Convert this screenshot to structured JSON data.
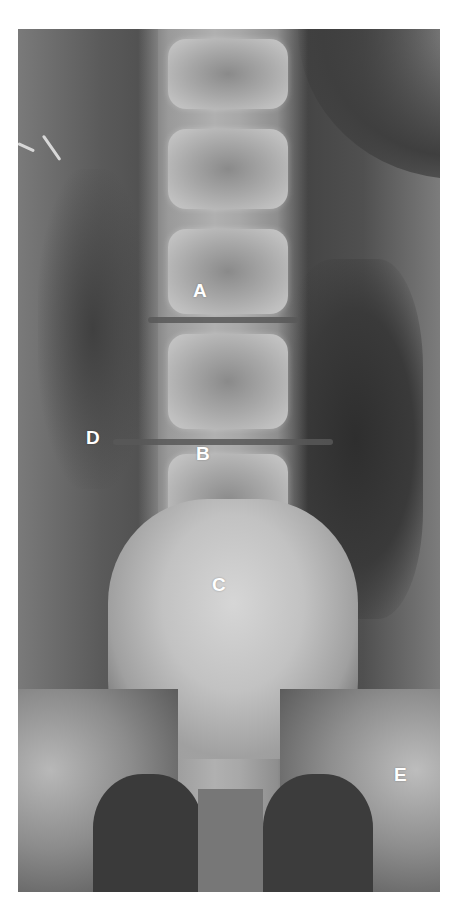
{
  "image": {
    "description": "Frontal (AP) lumbar spine radiograph with labeled anatomical points",
    "background_color": "#ffffff",
    "film_tone": "#6a6a6a"
  },
  "labels": [
    {
      "id": "A",
      "text": "A",
      "x": 193,
      "y": 281
    },
    {
      "id": "B",
      "text": "B",
      "x": 196,
      "y": 444
    },
    {
      "id": "C",
      "text": "C",
      "x": 212,
      "y": 575
    },
    {
      "id": "D",
      "text": "D",
      "x": 86,
      "y": 428
    },
    {
      "id": "E",
      "text": "E",
      "x": 394,
      "y": 765
    }
  ]
}
